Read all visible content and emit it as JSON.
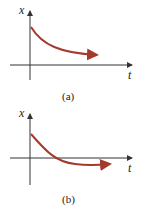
{
  "figures": [
    {
      "id": "a",
      "caption": "(a)",
      "y_axis_label": "x",
      "x_axis_label": "t",
      "description": "Exponential decay from positive value approaching zero without crossing"
    },
    {
      "id": "b",
      "caption": "(b)",
      "y_axis_label": "x",
      "x_axis_label": "t",
      "description": "Decay from positive value that crosses zero once then approaches zero from below"
    }
  ],
  "colors": {
    "curve": "#a33a2c",
    "axis": "#333333"
  }
}
